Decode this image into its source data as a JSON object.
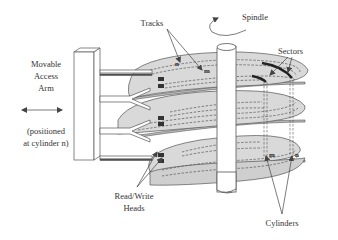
{
  "diagram": {
    "labels": {
      "arm_line1": "Movable",
      "arm_line2": "Access",
      "arm_line3": "Arm",
      "positioned_line1": "(positioned",
      "positioned_line2": "at cylinder n)",
      "tracks": "Tracks",
      "spindle": "Spindle",
      "sectors": "Sectors",
      "heads_line1": "Read/Write",
      "heads_line2": "Heads",
      "cylinders": "Cylinders",
      "track_n": "n",
      "track_m": "m",
      "cyl_m": "m",
      "cyl_n": "n"
    },
    "components": [
      "movable-access-arm",
      "platters",
      "spindle",
      "tracks",
      "sectors",
      "cylinders",
      "read-write-heads"
    ],
    "platter_count": 3,
    "colors": {
      "platter": "#d9d9d9",
      "outline": "#555555",
      "heads": "#333333",
      "text": "#333333"
    }
  }
}
